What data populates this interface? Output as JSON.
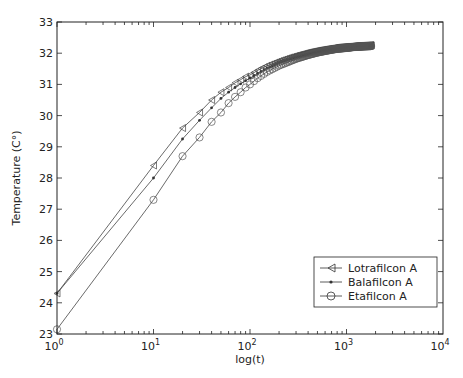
{
  "chart_data": {
    "type": "line",
    "title": "",
    "xlabel": "log(t)",
    "ylabel": "Temperature (C°)",
    "xscale": "log",
    "xlim": [
      1,
      10000
    ],
    "ylim": [
      23,
      33
    ],
    "x_ticks": [
      1,
      10,
      100,
      1000,
      10000
    ],
    "x_tick_labels": [
      [
        "10",
        "0"
      ],
      [
        "10",
        "1"
      ],
      [
        "10",
        "2"
      ],
      [
        "10",
        "3"
      ],
      [
        "10",
        "4"
      ]
    ],
    "y_ticks": [
      23,
      24,
      25,
      26,
      27,
      28,
      29,
      30,
      31,
      32,
      33
    ],
    "grid": false,
    "legend_position": "lower right",
    "x": [
      1,
      10,
      20,
      30,
      40,
      50,
      60,
      70,
      80,
      90,
      100,
      120,
      150,
      200,
      250,
      300,
      400,
      500,
      600,
      700,
      800,
      1000,
      1200,
      1500,
      1800
    ],
    "series": [
      {
        "name": "Lotrafilcon A",
        "marker": "triangle-left",
        "values": [
          24.3,
          28.4,
          29.6,
          30.1,
          30.5,
          30.75,
          30.9,
          31.05,
          31.15,
          31.25,
          31.3,
          31.45,
          31.6,
          31.75,
          31.85,
          31.92,
          32.02,
          32.08,
          32.12,
          32.15,
          32.18,
          32.2,
          32.22,
          32.24,
          32.25
        ]
      },
      {
        "name": "Balafilcon A",
        "marker": "dot",
        "values": [
          24.3,
          28.0,
          29.25,
          29.85,
          30.25,
          30.55,
          30.75,
          30.9,
          31.02,
          31.12,
          31.2,
          31.35,
          31.52,
          31.7,
          31.8,
          31.88,
          31.98,
          32.05,
          32.1,
          32.13,
          32.16,
          32.19,
          32.21,
          32.23,
          32.24
        ]
      },
      {
        "name": "Etafilcon A",
        "marker": "circle",
        "values": [
          23.15,
          27.3,
          28.7,
          29.3,
          29.8,
          30.1,
          30.4,
          30.6,
          30.75,
          30.9,
          31.0,
          31.2,
          31.4,
          31.6,
          31.72,
          31.82,
          31.94,
          32.02,
          32.07,
          32.11,
          32.14,
          32.17,
          32.2,
          32.22,
          32.23
        ]
      }
    ]
  }
}
